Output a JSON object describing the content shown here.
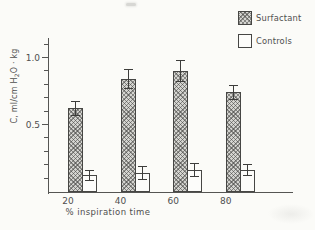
{
  "palette": {
    "background": "#fbfbf8",
    "ink": "#4a4a4a",
    "bar_outline": "#464644",
    "hatch_fill": "#d4d4d0",
    "open_fill": "#fcfcfa"
  },
  "chart_data": {
    "type": "bar",
    "title": "",
    "xlabel": "% inspiration time",
    "ylabel": "C, ml/cm H2O · kg",
    "ylabel_parts": {
      "pre": "C, ml/cm H",
      "sub": "2",
      "post": "O · kg"
    },
    "categories": [
      "20",
      "40",
      "60",
      "80"
    ],
    "series": [
      {
        "name": "Surfactant",
        "style": "hatched",
        "values": [
          0.62,
          0.84,
          0.9,
          0.74
        ],
        "errors": [
          0.05,
          0.07,
          0.08,
          0.05
        ]
      },
      {
        "name": "Controls",
        "style": "open",
        "values": [
          0.12,
          0.14,
          0.16,
          0.16
        ],
        "errors": [
          0.04,
          0.05,
          0.05,
          0.04
        ]
      }
    ],
    "ylim": [
      0,
      1.15
    ],
    "yticks_minor_step": 0.1,
    "yticks_labeled": [
      {
        "value": 0.5,
        "label": "0.5"
      },
      {
        "value": 1.0,
        "label": "1.0"
      }
    ],
    "error_bars": true,
    "grid": false,
    "legend_position": "top-right"
  }
}
